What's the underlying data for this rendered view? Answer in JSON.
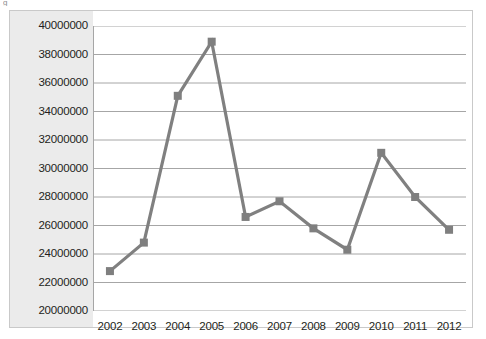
{
  "chart_data": {
    "type": "line",
    "title": "",
    "subtitle": "",
    "xlabel": "",
    "ylabel": "",
    "categories": [
      "2002",
      "2003",
      "2004",
      "2005",
      "2006",
      "2007",
      "2008",
      "2009",
      "2010",
      "2011",
      "2012"
    ],
    "series": [
      {
        "name": "",
        "values": [
          22800000,
          24800000,
          35100000,
          38900000,
          26600000,
          27700000,
          25800000,
          24300000,
          31100000,
          28000000,
          25700000
        ]
      }
    ],
    "ylim": [
      20000000,
      40000000
    ],
    "ytick_step": 2000000,
    "ytick_labels": [
      "40000000",
      "38000000",
      "36000000",
      "34000000",
      "32000000",
      "30000000",
      "28000000",
      "26000000",
      "24000000",
      "22000000",
      "20000000"
    ],
    "xtick_labels": [
      "2002",
      "2003",
      "2004",
      "2005",
      "2006",
      "2007",
      "2008",
      "2009",
      "2010",
      "2011",
      "2012"
    ],
    "grid": true,
    "grid_axis": "y",
    "legend": false,
    "legend_position": "none",
    "marker": "square",
    "colors": {
      "series_line": "#808080",
      "marker": "#7f7f7f",
      "gridline": "#a6a6a6",
      "axis": "#a6a6a6",
      "plot_background": "#ffffff",
      "label_band_background": "#ebebeb",
      "frame_border": "#c9c9c9",
      "tick_text": "#231f20"
    }
  },
  "artifact": {
    "glyph": "g"
  }
}
